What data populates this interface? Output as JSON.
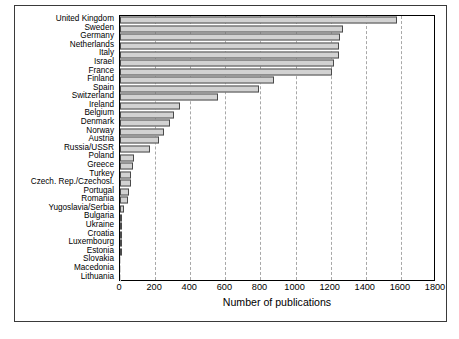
{
  "figure": {
    "xaxis_title": "Number of publications"
  },
  "chart_data": {
    "type": "bar",
    "orientation": "horizontal",
    "title": "",
    "xlabel": "Number of publications",
    "ylabel": "",
    "xlim": [
      0,
      1800
    ],
    "xticks": [
      0,
      200,
      400,
      600,
      800,
      1000,
      1200,
      1400,
      1600,
      1800
    ],
    "grid": "vertical-dashed",
    "legend": "none",
    "bar_color": "#d2d2d2",
    "bar_edge_color": "#4a4a4a",
    "categories": [
      "United Kingdom",
      "Sweden",
      "Germany",
      "Netherlands",
      "Italy",
      "Israel",
      "France",
      "Finland",
      "Spain",
      "Switzerland",
      "Ireland",
      "Belgium",
      "Denmark",
      "Norway",
      "Austria",
      "Russia/USSR",
      "Poland",
      "Greece",
      "Turkey",
      "Czech. Rep./Czechosl.",
      "Portugal",
      "Romania",
      "Yugoslavia/Serbia",
      "Bulgaria",
      "Ukraine",
      "Croatia",
      "Luxembourg",
      "Estonia",
      "Slovakia",
      "Macedonia",
      "Lithuania"
    ],
    "values": [
      1575,
      1270,
      1255,
      1250,
      1245,
      1220,
      1205,
      875,
      790,
      560,
      340,
      310,
      285,
      250,
      220,
      170,
      80,
      75,
      65,
      62,
      50,
      45,
      20,
      14,
      12,
      10,
      9,
      7,
      6,
      4,
      3
    ]
  }
}
